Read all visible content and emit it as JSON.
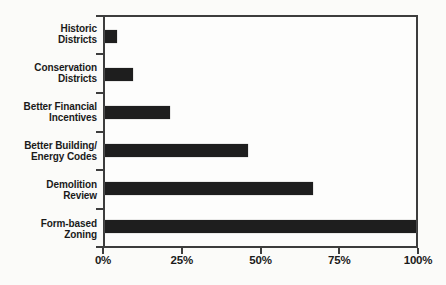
{
  "chart_data": {
    "type": "bar",
    "orientation": "horizontal",
    "title": "",
    "categories": [
      "Historic\nDistricts",
      "Conservation\nDistricts",
      "Better Financial\nIncentives",
      "Better Building/\nEnergy Codes",
      "Demolition\nReview",
      "Form-based\nZoning"
    ],
    "values": [
      4,
      9,
      21,
      46,
      67,
      100
    ],
    "value_unit": "%",
    "xlim": [
      0,
      100
    ],
    "x_tick_labels": [
      "0%",
      "25%",
      "50%",
      "75%",
      "100%"
    ],
    "x_tick_values": [
      0,
      25,
      50,
      75,
      100
    ],
    "grid": false,
    "legend": false,
    "bar_color": "#1e1e1e",
    "axis_color": "#3d3d3d",
    "label_color": "#1a1a1a"
  }
}
